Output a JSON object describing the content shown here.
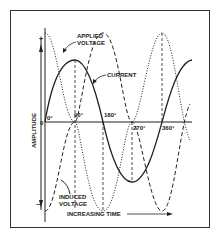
{
  "diagram": {
    "type": "waveform",
    "labels": {
      "applied_line1": "APPLIED",
      "applied_line2": "VOLTAGE",
      "current": "CURRENT",
      "induced_line1": "INDUCED",
      "induced_line2": "VOLTAGE",
      "y_axis": "AMPLITUDE",
      "x_axis": "INCREASING TIME",
      "origin": "0",
      "plus": "+",
      "minus": "−"
    },
    "ticks": [
      "0°",
      "90°",
      "180°",
      "270°",
      "360°"
    ],
    "series": [
      {
        "name": "Applied Voltage",
        "style": "dotted",
        "phase_deg": 90,
        "amplitude": 1.0
      },
      {
        "name": "Current",
        "style": "solid",
        "phase_deg": 0,
        "amplitude": 0.7
      },
      {
        "name": "Induced Voltage",
        "style": "dashed",
        "phase_deg": -90,
        "amplitude": 1.0
      }
    ],
    "colors": {
      "line": "#222222",
      "frame": "#333333",
      "background": "#ffffff"
    }
  }
}
